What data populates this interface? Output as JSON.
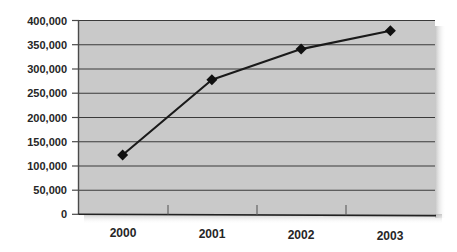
{
  "figure": {
    "title_remnant": "",
    "background_color": "#ffffff",
    "plot_background_color": "#c9c9c9",
    "gridline_color": "#3a3a3a",
    "series_color": "#1a1a1a",
    "marker_shape": "diamond"
  },
  "chart_data": {
    "type": "line",
    "title": "",
    "subtitle": "",
    "xlabel": "",
    "ylabel": "",
    "categories": [
      "2000",
      "2001",
      "2002",
      "2003"
    ],
    "x": [
      2000,
      2001,
      2002,
      2003
    ],
    "values": [
      122000,
      277000,
      340000,
      378000
    ],
    "series": [
      {
        "name": "",
        "values": [
          122000,
          277000,
          340000,
          378000
        ],
        "color": "#1a1a1a",
        "marker": "diamond"
      }
    ],
    "ylim": [
      0,
      400000
    ],
    "ytick_values": [
      0,
      50000,
      100000,
      150000,
      200000,
      250000,
      300000,
      350000,
      400000
    ],
    "ytick_labels": [
      "0",
      "50,000",
      "100,000",
      "150,000",
      "200,000",
      "250,000",
      "300,000",
      "350,000",
      "400,000"
    ],
    "xtick_labels": [
      "2000",
      "2001",
      "2002",
      "2003"
    ],
    "grid": true,
    "grid_axis": "y",
    "legend": false,
    "legend_position": "none"
  }
}
